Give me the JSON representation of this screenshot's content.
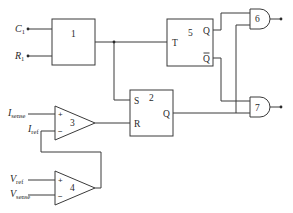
{
  "diagram": {
    "type": "circuit-schematic",
    "inputs": {
      "c1": {
        "main": "C",
        "sub": "1"
      },
      "r1": {
        "main": "R",
        "sub": "1"
      },
      "isense": {
        "main": "I",
        "sub": "sense"
      },
      "iref": {
        "main": "I",
        "sub": "ref"
      },
      "vref": {
        "main": "V",
        "sub": "ref"
      },
      "vsense": {
        "main": "V",
        "sub": "sense"
      }
    },
    "blocks": {
      "b1": {
        "number": "1"
      },
      "b2": {
        "number": "2",
        "pin_s": "S",
        "pin_r": "R",
        "pin_q": "Q"
      },
      "b5": {
        "number": "5",
        "pin_t": "T",
        "pin_q": "Q",
        "pin_qbar": "Q"
      }
    },
    "comparators": {
      "c3": {
        "number": "3",
        "plus": "+",
        "minus": "−"
      },
      "c4": {
        "number": "4",
        "plus": "+",
        "minus": "−"
      }
    },
    "gates": {
      "g6": {
        "number": "6",
        "type": "AND"
      },
      "g7": {
        "number": "7",
        "type": "AND"
      }
    },
    "colors": {
      "line": "#3a3a3a",
      "text": "#2a2a2a",
      "background": "#ffffff"
    }
  }
}
